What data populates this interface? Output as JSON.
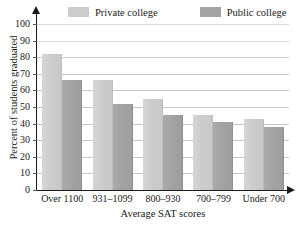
{
  "chart_data": {
    "type": "bar",
    "title": "",
    "xlabel": "Average SAT scores",
    "ylabel": "Percent of students graduated",
    "categories": [
      "Over 1100",
      "931–1099",
      "800–930",
      "700–799",
      "Under 700"
    ],
    "series": [
      {
        "name": "Private college",
        "values": [
          82,
          66,
          55,
          45,
          43
        ],
        "color": "#cccccc"
      },
      {
        "name": "Public college",
        "values": [
          66,
          52,
          45,
          41,
          38
        ],
        "color": "#a3a3a3"
      }
    ],
    "ylim": [
      0,
      100
    ],
    "yticks": [
      0,
      10,
      20,
      30,
      40,
      50,
      60,
      70,
      80,
      90,
      100
    ],
    "ytick_labels": [
      "0",
      "10",
      "20",
      "30",
      "40",
      "50",
      "60",
      "70",
      "80",
      "90",
      "100"
    ],
    "grid": true,
    "grid_axis": "y",
    "legend_position": "top"
  },
  "legend": {
    "items": [
      {
        "label": "Private college",
        "swatch_color": "#cccccc"
      },
      {
        "label": "Public college",
        "swatch_color": "#a3a3a3"
      }
    ]
  },
  "axes": {
    "y_title": "Percent of students graduated",
    "x_title": "Average SAT scores"
  }
}
